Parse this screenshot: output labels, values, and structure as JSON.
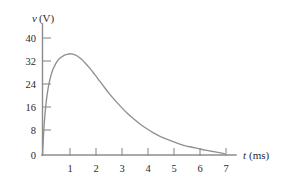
{
  "chart_data": {
    "type": "line",
    "title": "",
    "subtitle": "",
    "xlabel": "t (ms)",
    "xlabel_symbol": "t",
    "xlabel_unit": "(ms)",
    "ylabel": "v (V)",
    "ylabel_symbol": "v",
    "ylabel_unit": "(V)",
    "xlim": [
      0,
      7.4
    ],
    "ylim": [
      0,
      43
    ],
    "xticks": [
      0,
      1,
      2,
      3,
      4,
      5,
      6,
      7
    ],
    "xtick_labels": [
      "0",
      "1",
      "2",
      "3",
      "4",
      "5",
      "6",
      "7"
    ],
    "yticks": [
      0,
      8,
      16,
      24,
      32,
      40
    ],
    "ytick_labels": [
      "0",
      "8",
      "16",
      "24",
      "32",
      "40"
    ],
    "grid": false,
    "legend": null,
    "legend_position": "none",
    "annotations": [],
    "curve_color": "#8f8f8f",
    "axis_color": "#8c8c8c",
    "text_color": "#2b2b2b",
    "series": [
      {
        "name": "v(t)",
        "x": [
          0,
          0.05,
          0.1,
          0.15,
          0.2,
          0.25,
          0.3,
          0.35,
          0.4,
          0.5,
          0.6,
          0.7,
          0.8,
          0.9,
          1.0,
          1.1,
          1.2,
          1.3,
          1.4,
          1.5,
          1.6,
          1.8,
          2.0,
          2.2,
          2.4,
          2.6,
          2.8,
          3.0,
          3.25,
          3.5,
          3.75,
          4.0,
          4.25,
          4.5,
          4.75,
          5.0,
          5.25,
          5.5,
          5.75,
          6.0,
          6.25,
          6.5,
          6.75,
          7.0
        ],
        "y": [
          0,
          8.6,
          14.6,
          19.0,
          22.3,
          24.8,
          26.8,
          28.4,
          29.7,
          31.6,
          33.0,
          33.9,
          34.5,
          34.9,
          35.1,
          35.2,
          35.0,
          34.6,
          34.0,
          33.3,
          32.4,
          30.4,
          28.1,
          25.7,
          23.3,
          21.0,
          18.9,
          16.9,
          14.6,
          12.6,
          10.8,
          9.2,
          7.8,
          6.6,
          5.6,
          4.7,
          3.9,
          3.2,
          2.7,
          2.2,
          1.7,
          1.3,
          0.9,
          0.5
        ]
      }
    ],
    "peak": {
      "x": 1.1,
      "y": 35.2
    }
  }
}
